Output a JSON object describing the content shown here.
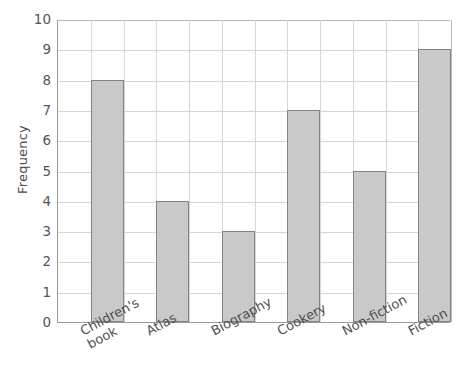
{
  "chart_data": {
    "type": "bar",
    "title": "",
    "xlabel": "",
    "ylabel": "Frequency",
    "categories": [
      "Children's\nbook",
      "Atlas",
      "Biography",
      "Cookery",
      "Non-fiction",
      "Fiction"
    ],
    "values": [
      8,
      4,
      3,
      7,
      5,
      9
    ],
    "ylim": [
      0,
      10
    ],
    "ytick_labels": [
      "0",
      "1",
      "2",
      "3",
      "4",
      "5",
      "6",
      "7",
      "8",
      "9",
      "10"
    ],
    "ytick_values": [
      0,
      1,
      2,
      3,
      4,
      5,
      6,
      7,
      8,
      9,
      10
    ],
    "grid": true,
    "legend": false,
    "bar_color": "#c9c9c9",
    "bar_edge_color": "#848484",
    "grid_color": "#d6d6d6",
    "axis_color": "#9a9a9a",
    "text_color": "#4f4f4f",
    "background": "#ffffff"
  }
}
